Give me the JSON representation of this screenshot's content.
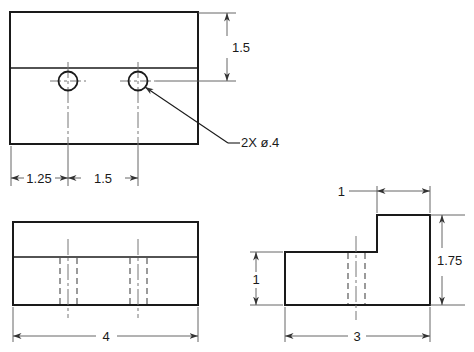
{
  "drawing": {
    "type": "orthographic-engineering-drawing",
    "title": "",
    "units": "inches (decimal)",
    "views": [
      {
        "name": "top-view",
        "label": "",
        "outline_width": 4,
        "outline_height": 3,
        "features": [
          {
            "name": "hole",
            "diameter": 0.4,
            "x_from_left": 1.25
          },
          {
            "name": "hole",
            "diameter": 0.4,
            "x_from_left": 2.75
          }
        ]
      },
      {
        "name": "front-view",
        "label": "",
        "outline_width": 4,
        "outline_height": 1.75,
        "step_height": 0.75
      },
      {
        "name": "right-side-view",
        "label": "",
        "outline_width": 3,
        "outline_height": 1.75,
        "step_width": 1,
        "step_low_height": 1
      }
    ]
  },
  "dimensions": {
    "top_view_vertical": "1.5",
    "top_view_hole1_offset": "1.25",
    "top_view_hole_spacing": "1.5",
    "front_view_width": "4",
    "side_view_step_width": "1",
    "side_view_low_height": "1",
    "side_view_total_height": "1.75",
    "side_view_width": "3"
  },
  "notes": {
    "hole_callout": "2X  ø.4"
  },
  "colors": {
    "object_line": "#1a1a1a",
    "dimension_line": "#555555",
    "hidden_line": "#666666",
    "center_line": "#777777",
    "background": "#ffffff"
  }
}
